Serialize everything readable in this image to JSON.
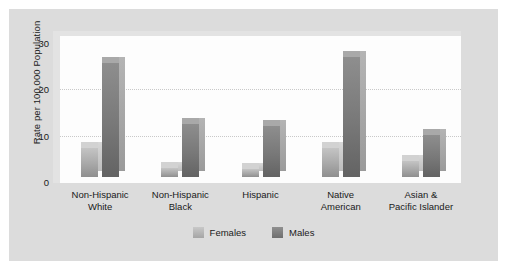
{
  "chart_data": {
    "type": "bar",
    "title": "",
    "subtitle": "",
    "xlabel": "",
    "ylabel": "Rate per 100,000 Population",
    "ylim": [
      0,
      30
    ],
    "yticks": [
      30,
      20,
      10,
      0
    ],
    "gridlines": [
      20,
      10
    ],
    "grid": true,
    "legend_position": "bottom-center",
    "categories": [
      "Non-Hispanic\nWhite",
      "Non-Hispanic\nBlack",
      "Hispanic",
      "Native\nAmerican",
      "Asian &\nPacific Islander"
    ],
    "category_lines": [
      [
        "Non-Hispanic",
        "White"
      ],
      [
        "Non-Hispanic",
        "Black"
      ],
      [
        "Hispanic",
        ""
      ],
      [
        "Native",
        "American"
      ],
      [
        "Asian &",
        "Pacific Islander"
      ]
    ],
    "series": [
      {
        "name": "Females",
        "color": "#a8a8a8",
        "values": [
          6.2,
          2.0,
          1.8,
          6.3,
          3.5
        ]
      },
      {
        "name": "Males",
        "color": "#787878",
        "values": [
          24.5,
          11.5,
          11.0,
          26.0,
          9.0
        ]
      }
    ]
  },
  "legend": {
    "items": [
      {
        "label": "Females"
      },
      {
        "label": "Males"
      }
    ]
  },
  "colors": {
    "figure_background": "#dcdcdc",
    "plot_background": "#fdfdfd",
    "plot_frame": "#e3e3e3",
    "gridline": "#c9c9c9",
    "text": "#1a1a1a",
    "females_bar": "#a8a8a8",
    "males_bar": "#787878"
  }
}
